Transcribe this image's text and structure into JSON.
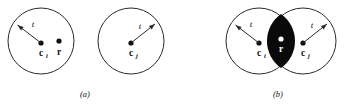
{
  "figure": {
    "width": 353,
    "height": 106,
    "background_color": "#ffffff",
    "stroke_color": "#2b2b2b",
    "fill_color": "#0a0a0a",
    "text_color": "#111111",
    "white_color": "#ffffff"
  },
  "panels": [
    {
      "id": "a",
      "caption": "(a)",
      "caption_x": 85,
      "caption_y": 97,
      "description": "Two disjoint circles of radius t centered at c_i and c_j; point r lies inside the left circle only."
    },
    {
      "id": "b",
      "caption": "(b)",
      "caption_x": 278,
      "caption_y": 97,
      "description": "Two overlapping circles of radius t centered at c_i and c_j; point r lies in the shaded lens-shaped intersection."
    }
  ],
  "circles": [
    {
      "name": "circle-a-left",
      "panel": "a",
      "cx": 41,
      "cy": 41,
      "r": 33,
      "center_label": "c",
      "center_subscript": "i",
      "center_label_x": 41,
      "center_label_y": 54,
      "dot_x": 41,
      "dot_y": 43
    },
    {
      "name": "circle-a-right",
      "panel": "a",
      "cx": 131,
      "cy": 41,
      "r": 33,
      "center_label": "c",
      "center_subscript": "j",
      "center_label_x": 131,
      "center_label_y": 54,
      "dot_x": 131,
      "dot_y": 43
    },
    {
      "name": "circle-b-left",
      "panel": "b",
      "cx": 259,
      "cy": 41,
      "r": 33,
      "center_label": "c",
      "center_subscript": "i",
      "center_label_x": 259,
      "center_label_y": 54,
      "dot_x": 259,
      "dot_y": 43
    },
    {
      "name": "circle-b-right",
      "panel": "b",
      "cx": 303,
      "cy": 41,
      "r": 33,
      "center_label": "c",
      "center_subscript": "j",
      "center_label_x": 303,
      "center_label_y": 54,
      "dot_x": 303,
      "dot_y": 43
    }
  ],
  "radius_arrows": [
    {
      "name": "radius-arrow-a-left",
      "panel": "a",
      "from_x": 41,
      "from_y": 43,
      "to_x": 17.5,
      "to_y": 25,
      "label": "t",
      "label_x": 33,
      "label_y": 25
    },
    {
      "name": "radius-arrow-a-right",
      "panel": "a",
      "from_x": 131,
      "from_y": 43,
      "to_x": 155,
      "to_y": 24,
      "label": "t",
      "label_x": 140,
      "label_y": 27
    },
    {
      "name": "radius-arrow-b-left",
      "panel": "b",
      "from_x": 259,
      "from_y": 43,
      "to_x": 235.5,
      "to_y": 25,
      "label": "t",
      "label_x": 251,
      "label_y": 25
    },
    {
      "name": "radius-arrow-b-right",
      "panel": "b",
      "from_x": 303,
      "from_y": 43,
      "to_x": 327,
      "to_y": 24,
      "label": "t",
      "label_x": 312,
      "label_y": 26
    }
  ],
  "points": [
    {
      "name": "point-r-panel-a",
      "panel": "a",
      "label": "r",
      "dot_x": 59,
      "dot_y": 41,
      "label_x": 59,
      "label_y": 53,
      "dot_color": "#111111",
      "label_color": "#111111"
    },
    {
      "name": "point-r-panel-b",
      "panel": "b",
      "label": "r",
      "dot_x": 281,
      "dot_y": 39,
      "label_x": 281,
      "label_y": 50,
      "dot_color": "#ffffff",
      "label_color": "#ffffff"
    }
  ],
  "lens": {
    "name": "intersection-lens",
    "panel": "b",
    "top_x": 281,
    "top_y": 14,
    "bottom_x": 281,
    "bottom_y": 68,
    "half_width": 11,
    "fill": "#0a0a0a"
  }
}
